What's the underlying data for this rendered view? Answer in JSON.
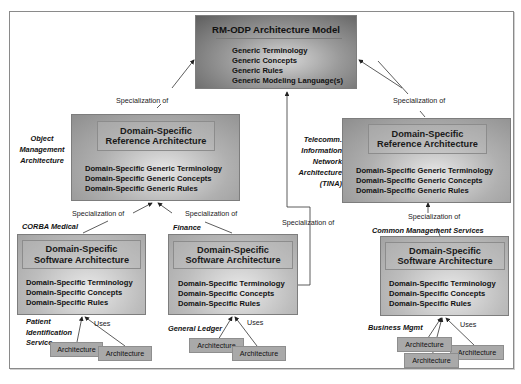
{
  "diagram": {
    "top": {
      "title": "RM-ODP Architecture Model",
      "items": [
        "Generic Terminology",
        "Generic Concepts",
        "Generic Rules",
        "Generic Modeling Language(s)"
      ]
    },
    "left_ref": {
      "side_label": [
        "Object",
        "Management",
        "Architecture"
      ],
      "title_line1": "Domain-Specific",
      "title_line2": "Reference Architecture",
      "items": [
        "Domain-Specific Generic Terminology",
        "Domain-Specific Generic Concepts",
        "Domain-Specific Generic Rules"
      ],
      "link_label": "Specialization of"
    },
    "right_ref": {
      "title_line1": "Domain-Specific",
      "title_line2": "Reference Architecture",
      "items": [
        "Domain-Specific Generic Terminology",
        "Domain-Specific Generic Concepts",
        "Domain-Specific Generic Rules"
      ],
      "link_label": "Specialization of"
    },
    "tina": {
      "label": [
        "Telecomm.",
        "Information",
        "Network",
        "Architecture",
        "(TINA)"
      ],
      "link_label": "Specialization of"
    },
    "sw_left": {
      "context_label": "CORBA Medical",
      "link_label": "Specialization of",
      "title_line1": "Domain-Specific",
      "title_line2": "Software Architecture",
      "items": [
        "Domain-Specific Terminology",
        "Domain-Specific Concepts",
        "Domain-Specific Rules"
      ],
      "app_label": [
        "Patient",
        "Identification",
        "Service"
      ],
      "uses_label": "Uses",
      "architectures": [
        "Architecture",
        "Architecture"
      ]
    },
    "sw_mid": {
      "context_label": "Finance",
      "link_label": "Specialization of",
      "title_line1": "Domain-Specific",
      "title_line2": "Software Architecture",
      "items": [
        "Domain-Specific Terminology",
        "Domain-Specific Concepts",
        "Domain-Specific Rules"
      ],
      "app_label": "General Ledger",
      "uses_label": "Uses",
      "architectures": [
        "Architecture",
        "Architecture"
      ]
    },
    "sw_right": {
      "context_label": "Common Management Services",
      "link_label": "Specialization of",
      "title_line1": "Domain-Specific",
      "title_line2": "Software Architecture",
      "items": [
        "Domain-Specific Terminology",
        "Domain-Specific Concepts",
        "Domain-Specific Rules"
      ],
      "app_label": "Business Mgmt",
      "uses_label": "Uses",
      "architectures": [
        "Architecture",
        "Architecture",
        "Architecture"
      ]
    },
    "colors": {
      "top_box_dark": "#5e5e5e",
      "ref_box": "#b0b0b0",
      "sw_box": "#bdbdbd",
      "arch_box": "#a9a9a9",
      "line": "#333333"
    }
  }
}
